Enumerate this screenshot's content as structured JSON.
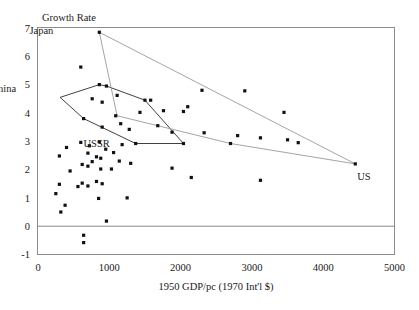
{
  "chart_data": {
    "type": "scatter",
    "title": "",
    "ylabel": "Growth Rate",
    "xlabel": "1950 GDP/pc (1970 Int'l $)",
    "xlim": [
      0,
      5000
    ],
    "ylim": [
      -1,
      7
    ],
    "xticks": [
      "0",
      "1000",
      "2000",
      "3000",
      "4000",
      "5000"
    ],
    "xtick_values": [
      0,
      1000,
      2000,
      3000,
      4000,
      5000
    ],
    "yticks": [
      "7",
      "6",
      "5",
      "4",
      "3",
      "2",
      "1",
      "0",
      "-1"
    ],
    "ytick_values": [
      7,
      6,
      5,
      4,
      3,
      2,
      1,
      0,
      -1
    ],
    "grid": false,
    "legend": "none",
    "zero_reference_line": 0,
    "annotations": [
      {
        "label": "Japan",
        "x": 860,
        "y": 6.85,
        "label_dx": -46,
        "label_dy": 2
      },
      {
        "label": "China",
        "x": 310,
        "y": 4.55,
        "label_dx": -44,
        "label_dy": -5
      },
      {
        "label": "USSR",
        "x": 1090,
        "y": 3.35,
        "label_dx": -6,
        "label_dy": 16
      },
      {
        "label": "US",
        "x": 4450,
        "y": 2.2,
        "label_dx": 2,
        "label_dy": 16
      }
    ],
    "hulls": [
      {
        "name": "dark-hull",
        "color": "#2b2b2b",
        "closed": true,
        "vertices": [
          [
            310,
            4.55
          ],
          [
            860,
            5.0
          ],
          [
            960,
            4.95
          ],
          [
            1500,
            4.45
          ],
          [
            2040,
            2.92
          ],
          [
            1370,
            2.92
          ],
          [
            640,
            3.8
          ]
        ]
      },
      {
        "name": "light-hull",
        "color": "#9a9a9a",
        "closed": true,
        "vertices": [
          [
            860,
            6.85
          ],
          [
            4450,
            2.2
          ],
          [
            2700,
            2.92
          ],
          [
            1110,
            3.9
          ]
        ]
      }
    ],
    "points": [
      [
        860,
        6.85
      ],
      [
        600,
        5.62
      ],
      [
        860,
        5.0
      ],
      [
        960,
        4.95
      ],
      [
        1110,
        4.62
      ],
      [
        1500,
        4.45
      ],
      [
        2300,
        4.8
      ],
      [
        2900,
        4.78
      ],
      [
        1580,
        4.45
      ],
      [
        1760,
        4.08
      ],
      [
        2100,
        4.22
      ],
      [
        900,
        4.38
      ],
      [
        760,
        4.5
      ],
      [
        1430,
        4.02
      ],
      [
        1090,
        3.9
      ],
      [
        2040,
        4.05
      ],
      [
        3450,
        4.02
      ],
      [
        640,
        3.8
      ],
      [
        1160,
        3.62
      ],
      [
        1680,
        3.55
      ],
      [
        900,
        3.5
      ],
      [
        1280,
        3.42
      ],
      [
        1880,
        3.32
      ],
      [
        2330,
        3.3
      ],
      [
        2800,
        3.2
      ],
      [
        3120,
        3.12
      ],
      [
        3500,
        3.05
      ],
      [
        3650,
        2.95
      ],
      [
        2700,
        2.92
      ],
      [
        2040,
        2.92
      ],
      [
        1370,
        2.92
      ],
      [
        860,
        2.98
      ],
      [
        1180,
        2.88
      ],
      [
        600,
        2.96
      ],
      [
        720,
        2.84
      ],
      [
        400,
        2.78
      ],
      [
        950,
        2.72
      ],
      [
        1060,
        2.6
      ],
      [
        300,
        2.48
      ],
      [
        700,
        2.58
      ],
      [
        820,
        2.45
      ],
      [
        880,
        2.4
      ],
      [
        1140,
        2.3
      ],
      [
        1300,
        2.22
      ],
      [
        1880,
        2.05
      ],
      [
        2150,
        1.72
      ],
      [
        760,
        2.28
      ],
      [
        620,
        2.18
      ],
      [
        700,
        2.12
      ],
      [
        1030,
        2.02
      ],
      [
        450,
        1.95
      ],
      [
        880,
        2.02
      ],
      [
        3120,
        1.62
      ],
      [
        4450,
        2.2
      ],
      [
        620,
        1.52
      ],
      [
        820,
        1.58
      ],
      [
        900,
        1.5
      ],
      [
        300,
        1.48
      ],
      [
        560,
        1.4
      ],
      [
        700,
        1.42
      ],
      [
        250,
        1.15
      ],
      [
        850,
        0.98
      ],
      [
        1250,
        1.0
      ],
      [
        380,
        0.74
      ],
      [
        320,
        0.5
      ],
      [
        960,
        0.18
      ],
      [
        640,
        -0.32
      ],
      [
        640,
        -0.58
      ]
    ]
  }
}
